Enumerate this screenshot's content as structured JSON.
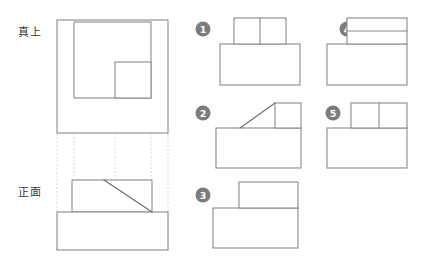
{
  "diagram": {
    "type": "orthographic-projection-puzzle",
    "language": "ja",
    "colors": {
      "stroke": "#8a8a8a",
      "diagonal": "#6f6f6f",
      "projection": "#cfcfcf",
      "marker_fill": "#7c7c7c",
      "marker_text": "#ffffff",
      "label_text": "#3a3a3a",
      "background": "#ffffff"
    },
    "views": [
      {
        "key": "top",
        "label": "真上",
        "label_x": 18,
        "label_y": 36,
        "outer": {
          "x": 57,
          "y": 20,
          "w": 111,
          "h": 113
        },
        "inner_rect": {
          "x": 74,
          "y": 22,
          "w": 77,
          "h": 76
        },
        "inner_square": {
          "x": 115,
          "y": 62,
          "w": 36,
          "h": 36
        }
      },
      {
        "key": "front",
        "label": "正面",
        "label_x": 18,
        "label_y": 196,
        "upper": {
          "x": 72,
          "y": 180,
          "w": 80,
          "h": 32
        },
        "lower": {
          "x": 57,
          "y": 212,
          "w": 111,
          "h": 38
        },
        "diagonal": {
          "x1": 104,
          "y1": 180,
          "x2": 152,
          "y2": 212
        }
      }
    ],
    "projection_lines": [
      {
        "x": 74,
        "y1": 99,
        "y2": 181
      },
      {
        "x": 115,
        "y1": 99,
        "y2": 181
      },
      {
        "x": 151,
        "y1": 99,
        "y2": 181
      },
      {
        "x": 57,
        "y1": 134,
        "y2": 251
      },
      {
        "x": 168,
        "y1": 134,
        "y2": 251
      }
    ],
    "options": [
      {
        "number": "1",
        "marker_cx": 203,
        "marker_cy": 29,
        "base": {
          "x": 220,
          "y": 44,
          "w": 80,
          "h": 41
        },
        "top": {
          "x": 234,
          "y": 18,
          "w": 52,
          "h": 26
        },
        "divider": {
          "x1": 260,
          "y1": 18,
          "x2": 260,
          "y2": 44
        },
        "diagonal": null
      },
      {
        "number": "2",
        "marker_cx": 203,
        "marker_cy": 113,
        "base": {
          "x": 216,
          "y": 128,
          "w": 85,
          "h": 40
        },
        "top": {
          "x": 275,
          "y": 103,
          "w": 26,
          "h": 25
        },
        "divider": null,
        "diagonal": {
          "x1": 240,
          "y1": 128,
          "x2": 275,
          "y2": 103
        }
      },
      {
        "number": "3",
        "marker_cx": 203,
        "marker_cy": 195,
        "base": {
          "x": 213,
          "y": 208,
          "w": 85,
          "h": 40
        },
        "top": {
          "x": 239,
          "y": 182,
          "w": 59,
          "h": 26
        },
        "divider": null,
        "diagonal": null
      },
      {
        "number": "4",
        "marker_cx": 347,
        "marker_cy": 29,
        "base": {
          "x": 327,
          "y": 44,
          "w": 80,
          "h": 41
        },
        "top": {
          "x": 347,
          "y": 18,
          "w": 60,
          "h": 26
        },
        "divider": {
          "x1": 347,
          "y1": 31,
          "x2": 407,
          "y2": 31
        },
        "diagonal": null
      },
      {
        "number": "5",
        "marker_cx": 333,
        "marker_cy": 113,
        "base": {
          "x": 327,
          "y": 128,
          "w": 80,
          "h": 40
        },
        "top": {
          "x": 351,
          "y": 103,
          "w": 56,
          "h": 25
        },
        "divider": {
          "x1": 379,
          "y1": 103,
          "x2": 379,
          "y2": 128
        },
        "diagonal": null
      }
    ]
  }
}
